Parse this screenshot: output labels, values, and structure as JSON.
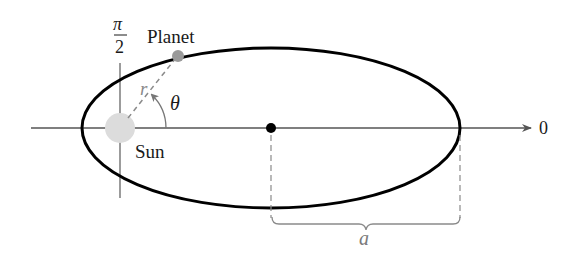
{
  "diagram": {
    "labels": {
      "pi_over_2_num": "π",
      "pi_over_2_den": "2",
      "planet": "Planet",
      "sun": "Sun",
      "r": "r",
      "theta": "θ",
      "zero": "0",
      "a": "a"
    },
    "geometry": {
      "polar_axis_y": 128,
      "polar_axis_x_start": 31,
      "polar_axis_x_end": 530,
      "vertical_axis_x": 120,
      "vertical_axis_y_start": 62,
      "vertical_axis_y_end": 198,
      "ellipse": {
        "cx": 271,
        "cy": 128,
        "rx": 189,
        "ry": 80
      },
      "sun": {
        "cx": 120,
        "cy": 128,
        "r": 15
      },
      "planet": {
        "cx": 178,
        "cy": 56,
        "r": 6
      },
      "center_dot": {
        "cx": 271,
        "cy": 128,
        "r": 5
      }
    },
    "colors": {
      "ellipse": "#000000",
      "axis": "#555555",
      "sun": "#dcdcdc",
      "planet": "#9a9a9a",
      "dashed": "#8a8a8a",
      "text": "#1a1a1a",
      "a_label": "#7a7a7a"
    }
  }
}
